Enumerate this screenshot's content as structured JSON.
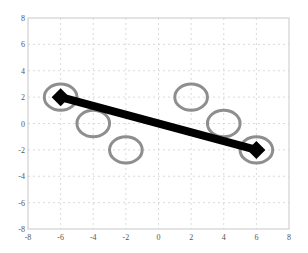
{
  "chart_data": {
    "type": "scatter",
    "title": "",
    "xlabel": "",
    "ylabel": "",
    "xlim": [
      -8,
      8
    ],
    "ylim": [
      -8,
      8
    ],
    "grid": true,
    "legend": null,
    "xticks": [
      -8,
      -6,
      -4,
      -2,
      0,
      2,
      4,
      6,
      8
    ],
    "yticks": [
      -8,
      -6,
      -4,
      -2,
      0,
      2,
      4,
      6,
      8
    ],
    "xtick_labels": [
      "-8",
      "-6",
      "-4",
      "-2",
      "0",
      "2",
      "4",
      "6",
      "8"
    ],
    "ytick_labels": [
      "-8",
      "-6",
      "-4",
      "-2",
      "0",
      "2",
      "4",
      "6",
      "8"
    ],
    "series": [
      {
        "name": "circles",
        "marker": "circle-outline",
        "radius": 1,
        "color": "#7a7a7a",
        "points": [
          {
            "x": -6,
            "y": 2
          },
          {
            "x": -4,
            "y": 0
          },
          {
            "x": -2,
            "y": -2
          },
          {
            "x": 2,
            "y": 2
          },
          {
            "x": 4,
            "y": 0
          },
          {
            "x": 6,
            "y": -2
          }
        ]
      },
      {
        "name": "line",
        "marker": "diamond",
        "color": "#000000",
        "line_width": 8,
        "points": [
          {
            "x": -6,
            "y": 2
          },
          {
            "x": 6,
            "y": -2
          }
        ]
      }
    ]
  },
  "colors": {
    "axes": "#c8c8c8",
    "grid": "#d0d0d0",
    "circle": "#7a7a7a",
    "line": "#000000",
    "tick_text": "#555555"
  }
}
